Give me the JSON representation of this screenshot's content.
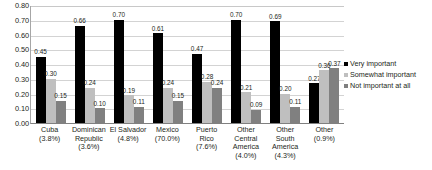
{
  "chart_data": {
    "type": "bar",
    "title": "",
    "subtitle": "",
    "xlabel": "",
    "ylabel": "",
    "ylim": [
      0.0,
      0.8
    ],
    "ytick_labels": [
      "0.80",
      "0.70",
      "0.60",
      "0.50",
      "0.40",
      "0.30",
      "0.20",
      "0.10",
      "0.00"
    ],
    "ytick_values": [
      0.8,
      0.7,
      0.6,
      0.5,
      0.4,
      0.3,
      0.2,
      0.1,
      0.0
    ],
    "grid": true,
    "legend_position": "right",
    "categories": [
      "Cuba",
      "Dominican Republic",
      "El Salvador",
      "Mexico",
      "Puerto Rico",
      "Other Central America",
      "Other South America",
      "Other"
    ],
    "category_labels": [
      {
        "name": "Cuba",
        "percent": "(3.8%)"
      },
      {
        "name": "Dominican Republic",
        "percent": "(3.6%)"
      },
      {
        "name": "El Salvador",
        "percent": "(4.8%)"
      },
      {
        "name": "Mexico",
        "percent": "(70.0%)"
      },
      {
        "name": "Puerto Rico",
        "percent": "(7.6%)"
      },
      {
        "name": "Other Central America",
        "percent": "(4.0%)"
      },
      {
        "name": "Other South America",
        "percent": "(4.3%)"
      },
      {
        "name": "Other",
        "percent": "(0.9%)"
      }
    ],
    "series": [
      {
        "name": "Very important",
        "color": "#000000",
        "values": [
          0.45,
          0.66,
          0.7,
          0.61,
          0.47,
          0.7,
          0.69,
          0.27
        ],
        "labels": [
          "0.45",
          "0.66",
          "0.70",
          "0.61",
          "0.47",
          "0.70",
          "0.69",
          "0.27"
        ]
      },
      {
        "name": "Somewhat important",
        "color": "#bfbfbf",
        "values": [
          0.3,
          0.24,
          0.19,
          0.24,
          0.28,
          0.21,
          0.2,
          0.36
        ],
        "labels": [
          "0.30",
          "0.24",
          "0.19",
          "0.24",
          "0.28",
          "0.21",
          "0.20",
          "0.36"
        ]
      },
      {
        "name": "Not important at all",
        "color": "#808080",
        "values": [
          0.15,
          0.1,
          0.11,
          0.15,
          0.24,
          0.09,
          0.11,
          0.37
        ],
        "labels": [
          "0.15",
          "0.10",
          "0.11",
          "0.15",
          "0.24",
          "0.09",
          "0.11",
          "0.37"
        ]
      }
    ]
  },
  "legend": {
    "items": [
      {
        "label": "Very important",
        "color": "#000000"
      },
      {
        "label": "Somewhat important",
        "color": "#bfbfbf"
      },
      {
        "label": "Not important at all",
        "color": "#808080"
      }
    ]
  }
}
